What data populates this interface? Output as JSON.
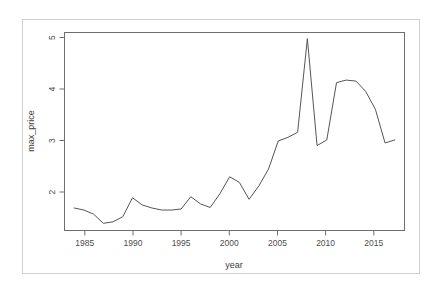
{
  "chart_data": {
    "type": "line",
    "title": "",
    "subtitle": "",
    "xlabel": "year",
    "ylabel": "max_price",
    "xlim": [
      1983.0,
      2018.0
    ],
    "ylim": [
      1.28,
      5.15
    ],
    "grid": false,
    "legend": "none",
    "x_ticks": [
      1985,
      1990,
      1995,
      2000,
      2005,
      2010,
      2015
    ],
    "x_tick_labels": [
      "1985",
      "1990",
      "1995",
      "2000",
      "2005",
      "2010",
      "2015"
    ],
    "y_ticks": [
      2,
      3,
      4,
      5
    ],
    "y_tick_labels": [
      "2",
      "3",
      "4",
      "5"
    ],
    "series": [
      {
        "name": "max_price",
        "color": "#555555",
        "x": [
          1984,
          1985,
          1986,
          1987,
          1988,
          1989,
          1990,
          1991,
          1992,
          1993,
          1994,
          1995,
          1996,
          1997,
          1998,
          1999,
          2000,
          2001,
          2002,
          2003,
          2004,
          2005,
          2006,
          2007,
          2008,
          2009,
          2010,
          2011,
          2012,
          2013,
          2014,
          2015,
          2016,
          2017
        ],
        "values": [
          1.72,
          1.68,
          1.6,
          1.42,
          1.45,
          1.55,
          1.92,
          1.78,
          1.72,
          1.68,
          1.68,
          1.7,
          1.94,
          1.8,
          1.73,
          2.0,
          2.33,
          2.22,
          1.89,
          2.15,
          2.48,
          3.03,
          3.1,
          3.2,
          5.03,
          2.94,
          3.05,
          4.17,
          4.22,
          4.2,
          4.0,
          3.65,
          2.99,
          3.05
        ]
      }
    ]
  },
  "axis": {
    "x_title": "year",
    "y_title": "max_price"
  }
}
